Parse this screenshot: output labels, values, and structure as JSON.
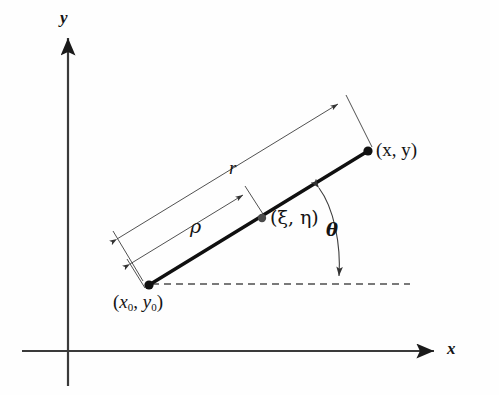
{
  "figure": {
    "background_color": "#fefefe",
    "stroke_color": "#1a1a1a",
    "thin_stroke_color": "#444444",
    "dash_color": "#555555"
  },
  "axes": {
    "y_label": "y",
    "x_label": "x",
    "origin": {
      "x": 68,
      "y": 351
    },
    "y_axis": {
      "x": 68,
      "top": 34,
      "bottom": 386
    },
    "x_axis": {
      "y": 351,
      "left": 22,
      "right": 440
    }
  },
  "points": {
    "start": {
      "label_open": "(",
      "label_x": "x",
      "label_sub1": "0",
      "label_comma": ", ",
      "label_y": "y",
      "label_sub2": "0",
      "label_close": ")",
      "full_label": "(x0, y0)",
      "cx": 149,
      "cy": 285,
      "marker": "filled-dot",
      "color": "#111111"
    },
    "end": {
      "full_label": "(x, y)",
      "cx": 368,
      "cy": 151,
      "marker": "filled-dot",
      "color": "#111111"
    },
    "intermediate": {
      "full_label": "(ξ, η)",
      "cx": 262,
      "cy": 218,
      "marker": "filled-dot",
      "color": "#4a4a4a"
    }
  },
  "measures": {
    "r": {
      "label": "r",
      "description": "full length from (x0,y0) to (x,y)",
      "label_x": 229,
      "label_y": 158
    },
    "rho": {
      "label": "ρ",
      "description": "partial length from (x0,y0) to (ξ,η)",
      "label_x": 190,
      "label_y": 218
    },
    "theta": {
      "label": "θ",
      "description": "angle between segment and horizontal dashed line",
      "label_x": 326,
      "label_y": 222
    }
  },
  "dashed_line": {
    "name": "horizontal-reference-line",
    "y": 284,
    "x_start": 152,
    "x_end": 410
  }
}
